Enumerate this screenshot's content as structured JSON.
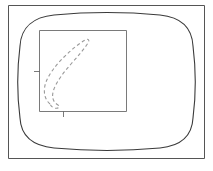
{
  "figure": {
    "title": "",
    "caption": "",
    "background_color": "#ffffff",
    "width": 213,
    "height": 171,
    "colors": {
      "outer_frame": "#555555",
      "rounded_boundary": "#3a3a3a",
      "inner_square": "#6b6b6b",
      "tick": "#6b6b6b",
      "dashed_contour": "#9a9a9a"
    },
    "elements": [
      {
        "name": "outer-frame",
        "kind": "rectangle",
        "label": "Outer frame",
        "x": 8,
        "y": 5,
        "width": 197,
        "height": 154
      },
      {
        "name": "rounded-boundary",
        "kind": "rounded-barrel",
        "label": "Rounded boundary",
        "x": 19,
        "y": 15,
        "width": 175,
        "height": 134,
        "corner_radius": 34
      },
      {
        "name": "inner-square",
        "kind": "rectangle",
        "label": "Inner region",
        "x": 39,
        "y": 30,
        "width": 88,
        "height": 82
      },
      {
        "name": "dashed-contour",
        "kind": "closed-dashed-loop",
        "label": "Dashed contour",
        "style": "dashed"
      },
      {
        "name": "left-axis-tick",
        "kind": "tick",
        "label": "Left tick",
        "x": 39,
        "y": 71,
        "length": 6,
        "orientation": "horizontal"
      },
      {
        "name": "bottom-axis-tick",
        "kind": "tick",
        "label": "Bottom tick",
        "x": 63,
        "y": 112,
        "length": 6,
        "orientation": "vertical"
      }
    ],
    "contour_path": "M 50 104 C 44 99 43 90 46 82 C 49 74 56 65 64 57 C 72 49 80 43 85 40 C 88 38 90 40 88 43 C 85 48 78 56 71 64 C 64 72 57 81 54 89 C 51 97 53 102 58 105 C 61 107 58 109 54 108 C 52 107 51 106 50 104 Z"
  }
}
